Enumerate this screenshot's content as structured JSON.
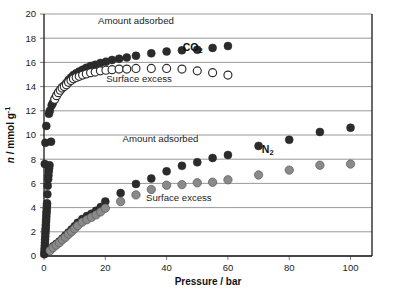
{
  "chart_data": {
    "type": "scatter",
    "title": "",
    "xlabel": "Pressure / bar",
    "ylabel": "n / mmol g",
    "ylabel_sup": "-1",
    "ylabel_unit": "mmol g",
    "xlim": [
      0,
      107
    ],
    "ylim": [
      0,
      20
    ],
    "xticks": [
      0,
      20,
      40,
      60,
      80,
      100
    ],
    "yticks": [
      0,
      2,
      4,
      6,
      8,
      10,
      12,
      14,
      16,
      18,
      20
    ],
    "grid": "horizontal",
    "legend": "inline-annotations",
    "annotations": [
      {
        "id": "co2-amount-adsorbed",
        "text": "Amount adsorbed",
        "x": 30,
        "y": 19.2
      },
      {
        "id": "co2-surface-excess",
        "text": "Surface excess",
        "x": 31,
        "y": 14.35
      },
      {
        "id": "co2-series",
        "text": "CO",
        "sub": "2",
        "x": 48.5,
        "y": 16.95
      },
      {
        "id": "n2-amount-adsorbed",
        "text": "Amount adsorbed",
        "x": 38,
        "y": 9.4
      },
      {
        "id": "n2-surface-excess",
        "text": "Surface excess",
        "x": 44,
        "y": 4.55
      },
      {
        "id": "n2-series",
        "text": "N",
        "sub": "2",
        "x": 73,
        "y": 8.55
      }
    ],
    "series": [
      {
        "name": "CO2 amount adsorbed",
        "marker": "filled-circle",
        "color": "#2b2b2b",
        "size": 4.0,
        "points": [
          [
            0.25,
            7.6
          ],
          [
            0.45,
            9.35
          ],
          [
            0.75,
            10.75
          ],
          [
            1.6,
            11.75
          ],
          [
            1.9,
            12.0
          ],
          [
            2.5,
            12.45
          ],
          [
            2.9,
            12.65
          ],
          [
            3.5,
            13.0
          ],
          [
            4.1,
            13.3
          ],
          [
            4.7,
            13.55
          ],
          [
            5.3,
            13.75
          ],
          [
            5.9,
            13.95
          ],
          [
            6.6,
            14.1
          ],
          [
            7.3,
            14.3
          ],
          [
            8.0,
            14.55
          ],
          [
            8.8,
            14.75
          ],
          [
            9.6,
            14.95
          ],
          [
            10.5,
            15.1
          ],
          [
            11.5,
            15.25
          ],
          [
            12.6,
            15.4
          ],
          [
            13.8,
            15.55
          ],
          [
            15.2,
            15.7
          ],
          [
            16.7,
            15.8
          ],
          [
            18.4,
            15.95
          ],
          [
            20.2,
            16.05
          ],
          [
            22.2,
            16.2
          ],
          [
            24.5,
            16.3
          ],
          [
            27.0,
            16.4
          ],
          [
            30.0,
            16.55
          ],
          [
            35.0,
            16.75
          ],
          [
            40.0,
            16.9
          ],
          [
            45.0,
            17.0
          ],
          [
            50.0,
            17.05
          ],
          [
            55.0,
            17.2
          ],
          [
            60.0,
            17.35
          ]
        ]
      },
      {
        "name": "CO2 surface excess",
        "marker": "open-circle",
        "color": "#2b2b2b",
        "size": 4.0,
        "points": [
          [
            3.5,
            12.95
          ],
          [
            4.1,
            13.25
          ],
          [
            4.7,
            13.5
          ],
          [
            5.3,
            13.7
          ],
          [
            5.9,
            13.88
          ],
          [
            6.6,
            14.0
          ],
          [
            7.3,
            14.15
          ],
          [
            8.0,
            14.35
          ],
          [
            8.8,
            14.5
          ],
          [
            9.6,
            14.65
          ],
          [
            10.5,
            14.75
          ],
          [
            11.5,
            14.85
          ],
          [
            12.6,
            14.95
          ],
          [
            13.8,
            15.05
          ],
          [
            15.2,
            15.15
          ],
          [
            16.7,
            15.2
          ],
          [
            18.4,
            15.3
          ],
          [
            20.2,
            15.35
          ],
          [
            22.2,
            15.4
          ],
          [
            24.5,
            15.45
          ],
          [
            27.0,
            15.45
          ],
          [
            30.0,
            15.5
          ],
          [
            35.0,
            15.5
          ],
          [
            40.0,
            15.5
          ],
          [
            45.0,
            15.45
          ],
          [
            50.0,
            15.3
          ],
          [
            55.0,
            15.15
          ],
          [
            60.0,
            14.95
          ]
        ]
      },
      {
        "name": "N2 amount adsorbed",
        "marker": "filled-circle",
        "color": "#2b2b2b",
        "size": 4.0,
        "points": [
          [
            0.1,
            0.15
          ],
          [
            0.15,
            0.35
          ],
          [
            0.2,
            0.6
          ],
          [
            0.25,
            0.85
          ],
          [
            0.3,
            1.1
          ],
          [
            0.35,
            1.35
          ],
          [
            0.4,
            1.6
          ],
          [
            0.45,
            1.85
          ],
          [
            0.5,
            2.1
          ],
          [
            0.55,
            2.3
          ],
          [
            0.6,
            2.55
          ],
          [
            0.65,
            2.8
          ],
          [
            0.7,
            3.0
          ],
          [
            0.75,
            3.25
          ],
          [
            0.8,
            3.5
          ],
          [
            0.85,
            3.7
          ],
          [
            0.9,
            3.95
          ],
          [
            0.95,
            4.15
          ],
          [
            1.0,
            4.35
          ],
          [
            1.1,
            5.1
          ],
          [
            1.2,
            5.8
          ],
          [
            1.35,
            6.35
          ],
          [
            1.45,
            6.65
          ],
          [
            1.55,
            7.0
          ],
          [
            1.65,
            7.25
          ],
          [
            1.8,
            7.5
          ],
          [
            2.3,
            9.45
          ],
          [
            2.0,
            0.5
          ],
          [
            3.0,
            0.8
          ],
          [
            4.0,
            1.0
          ],
          [
            5.0,
            1.2
          ],
          [
            6.0,
            1.45
          ],
          [
            7.0,
            1.7
          ],
          [
            8.0,
            1.95
          ],
          [
            9.0,
            2.2
          ],
          [
            10.0,
            2.45
          ],
          [
            11.0,
            2.75
          ],
          [
            12.5,
            3.05
          ],
          [
            14.0,
            3.3
          ],
          [
            15.5,
            3.5
          ],
          [
            17.0,
            3.75
          ],
          [
            18.5,
            4.05
          ],
          [
            20.0,
            4.5
          ],
          [
            25.0,
            5.2
          ],
          [
            30.0,
            5.95
          ],
          [
            35.0,
            6.4
          ],
          [
            40.0,
            7.0
          ],
          [
            45.0,
            7.45
          ],
          [
            50.0,
            7.75
          ],
          [
            55.0,
            8.1
          ],
          [
            60.0,
            8.35
          ],
          [
            70.0,
            9.1
          ],
          [
            80.0,
            9.6
          ],
          [
            90.0,
            10.25
          ],
          [
            100.0,
            10.6
          ]
        ]
      },
      {
        "name": "N2 surface excess",
        "marker": "filled-circle-gray",
        "color": "#8a8a8a",
        "size": 4.2,
        "points": [
          [
            2.0,
            0.45
          ],
          [
            3.0,
            0.7
          ],
          [
            4.0,
            0.9
          ],
          [
            5.0,
            1.1
          ],
          [
            6.0,
            1.35
          ],
          [
            7.0,
            1.55
          ],
          [
            8.0,
            1.8
          ],
          [
            9.0,
            2.0
          ],
          [
            10.0,
            2.25
          ],
          [
            11.0,
            2.5
          ],
          [
            12.5,
            2.8
          ],
          [
            14.0,
            3.0
          ],
          [
            15.5,
            3.2
          ],
          [
            17.0,
            3.4
          ],
          [
            18.5,
            3.65
          ],
          [
            20.0,
            3.95
          ],
          [
            25.0,
            4.5
          ],
          [
            30.0,
            5.05
          ],
          [
            35.0,
            5.5
          ],
          [
            40.0,
            5.85
          ],
          [
            45.0,
            5.9
          ],
          [
            50.0,
            6.05
          ],
          [
            55.0,
            6.1
          ],
          [
            60.0,
            6.3
          ],
          [
            70.0,
            6.7
          ],
          [
            80.0,
            7.1
          ],
          [
            90.0,
            7.5
          ],
          [
            100.0,
            7.6
          ]
        ]
      }
    ]
  },
  "geometry": {
    "width": 396,
    "height": 290,
    "plot_left": 44,
    "plot_right": 372,
    "plot_top": 14,
    "plot_bottom": 256
  },
  "colors": {
    "background": "#ffffff",
    "grid": "#8c8c8c",
    "axis": "#1a1a1a",
    "filled_marker": "#2b2b2b",
    "gray_marker": "#8a8a8a",
    "text": "#1c1c1c"
  }
}
